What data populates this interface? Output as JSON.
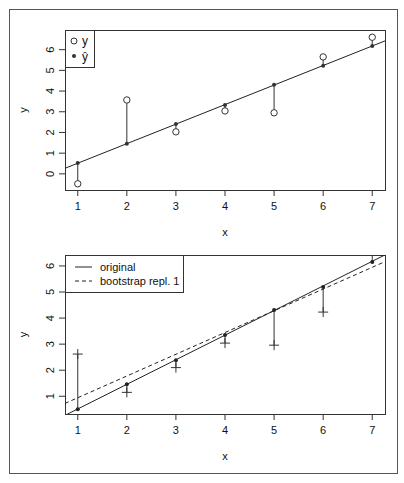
{
  "chart_data": [
    {
      "type": "scatter",
      "title": "",
      "xlabel": "x",
      "ylabel": "y",
      "xlim": [
        0.74,
        7.26
      ],
      "ylim": [
        -0.78,
        6.95
      ],
      "xticks": [
        1,
        2,
        3,
        4,
        5,
        6,
        7
      ],
      "yticks": [
        0,
        1,
        2,
        3,
        4,
        5,
        6
      ],
      "grid": false,
      "legend_position": "topleft",
      "legend": [
        {
          "label": "y",
          "marker": "open-circle"
        },
        {
          "label": "ŷ",
          "marker": "filled-dot"
        }
      ],
      "x": [
        1,
        2,
        3,
        4,
        5,
        6,
        7
      ],
      "series": [
        {
          "name": "y",
          "values": [
            -0.48,
            3.57,
            2.03,
            3.04,
            2.95,
            5.65,
            6.6
          ]
        },
        {
          "name": "ŷ",
          "values": [
            0.53,
            1.45,
            2.41,
            3.33,
            4.3,
            5.22,
            6.18
          ]
        }
      ],
      "fit_line": {
        "intercept": -0.43,
        "slope": 0.944
      },
      "residual_segments": true
    },
    {
      "type": "scatter",
      "title": "",
      "xlabel": "x",
      "ylabel": "y",
      "xlim": [
        0.74,
        7.26
      ],
      "ylim": [
        0.32,
        6.42
      ],
      "xticks": [
        1,
        2,
        3,
        4,
        5,
        6,
        7
      ],
      "yticks": [
        1,
        2,
        3,
        4,
        5,
        6
      ],
      "grid": false,
      "legend_position": "topleft",
      "legend": [
        {
          "label": "original",
          "line": "solid"
        },
        {
          "label": "bootstrap repl. 1",
          "line": "dashed"
        }
      ],
      "x": [
        1,
        2,
        3,
        4,
        5,
        6,
        7
      ],
      "series": [
        {
          "name": "fitted (original)",
          "marker": "filled-dot",
          "values": [
            0.5,
            1.46,
            2.38,
            3.35,
            4.31,
            5.19,
            6.15
          ]
        },
        {
          "name": "bootstrap y",
          "marker": "plus",
          "values": [
            2.62,
            1.15,
            2.1,
            3.04,
            2.96,
            4.23,
            6.6
          ]
        }
      ],
      "lines": [
        {
          "name": "original",
          "style": "solid",
          "intercept": -0.43,
          "slope": 0.944
        },
        {
          "name": "bootstrap repl. 1",
          "style": "dashed",
          "intercept": 0.11,
          "slope": 0.834
        }
      ],
      "residual_segments": true
    }
  ]
}
